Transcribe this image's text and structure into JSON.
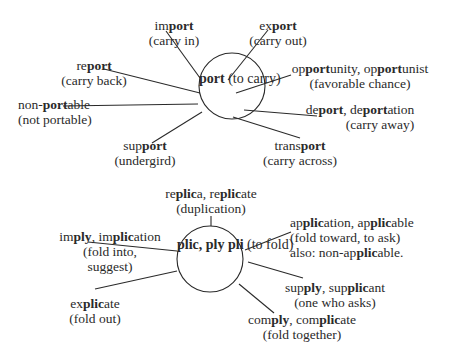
{
  "diagrams": [
    {
      "name": "port-diagram",
      "hub": {
        "root": "port",
        "meaning": "(to carry)"
      },
      "branches": [
        {
          "id": "import",
          "word_parts": [
            "im",
            "port",
            ""
          ],
          "meaning": "(carry in)"
        },
        {
          "id": "export",
          "word_parts": [
            "ex",
            "port",
            ""
          ],
          "meaning": "(carry out)"
        },
        {
          "id": "report",
          "word_parts": [
            "re",
            "port",
            ""
          ],
          "meaning": "(carry back)"
        },
        {
          "id": "opportunity",
          "word_parts": [
            "op",
            "port",
            "unity, ",
            "op",
            "port",
            "unist"
          ],
          "meaning": "(favorable chance)"
        },
        {
          "id": "non-portable",
          "word_parts": [
            "non-",
            "port",
            "able"
          ],
          "meaning": "(not portable)"
        },
        {
          "id": "deport",
          "word_parts": [
            "de",
            "port",
            ",  de",
            "port",
            "ation"
          ],
          "meaning": "(carry away)"
        },
        {
          "id": "support",
          "word_parts": [
            "sup",
            "port",
            ""
          ],
          "meaning": "(undergird)"
        },
        {
          "id": "transport",
          "word_parts": [
            "trans",
            "port",
            ""
          ],
          "meaning": "(carry across)"
        }
      ]
    },
    {
      "name": "plic-diagram",
      "hub": {
        "root": "plic, ply",
        "root2": "pli",
        "meaning": "(to fold)"
      },
      "branches": [
        {
          "id": "replica",
          "word_parts": [
            "re",
            "plic",
            "a, re",
            "plic",
            "ate"
          ],
          "meaning": "(duplication)"
        },
        {
          "id": "imply",
          "word_parts": [
            "im",
            "ply",
            ",  im",
            "plic",
            "ation"
          ],
          "meaning": "(fold into,",
          "meaning2": "suggest)"
        },
        {
          "id": "application",
          "word_parts": [
            "ap",
            "plic",
            "ation,  ap",
            "plic",
            "able"
          ],
          "meaning": "(fold toward, to ask)",
          "extra": [
            "also: non-ap",
            "plic",
            "able."
          ]
        },
        {
          "id": "explicate",
          "word_parts": [
            "ex",
            "plic",
            "ate"
          ],
          "meaning": "(fold out)"
        },
        {
          "id": "supply",
          "word_parts": [
            "sup",
            "ply",
            ",  sup",
            "plic",
            "ant"
          ],
          "meaning": "(one who asks)"
        },
        {
          "id": "comply",
          "word_parts": [
            "com",
            "ply",
            ", com",
            "plic",
            "ate"
          ],
          "meaning": "(fold together)"
        }
      ]
    }
  ]
}
